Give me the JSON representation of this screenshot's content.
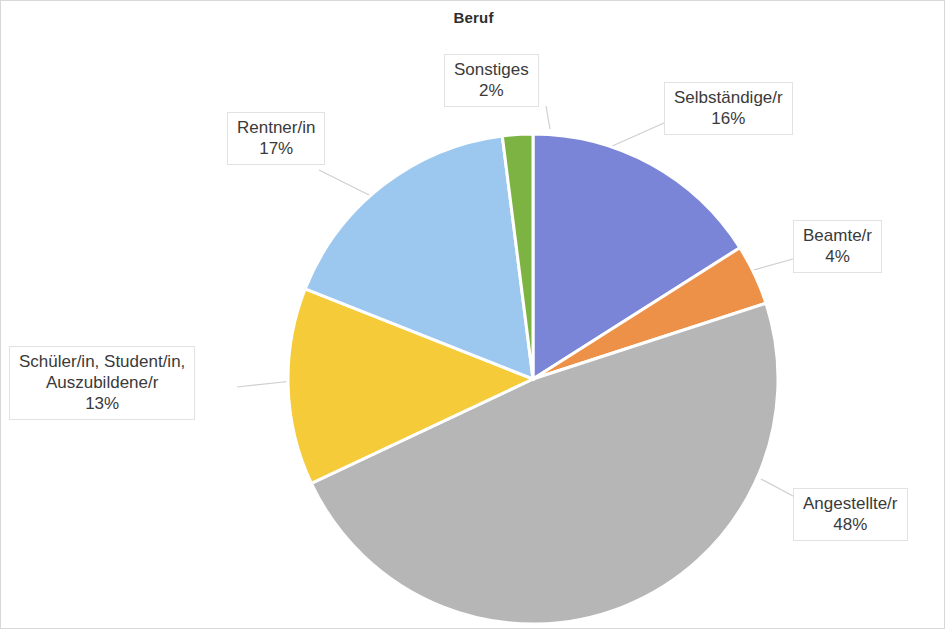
{
  "chart": {
    "title": "Beruf"
  },
  "chart_data": {
    "type": "pie",
    "title": "Beruf",
    "xlabel": "",
    "ylabel": "",
    "unit": "%",
    "start_angle_deg": 0,
    "direction": "clockwise",
    "legend": "none (direct callout labels with leader lines)",
    "grid": false,
    "categories": [
      "Selbständige/r",
      "Beamte/r",
      "Angestellte/r",
      "Schüler/in, Student/in, Auszubildene/r",
      "Rentner/in",
      "Sonstiges"
    ],
    "values": [
      16,
      4,
      48,
      13,
      17,
      2
    ],
    "labels": [
      "16%",
      "4%",
      "48%",
      "13%",
      "17%",
      "2%"
    ],
    "colors": [
      "#7b85d8",
      "#ed9149",
      "#b6b6b6",
      "#f6cb3a",
      "#9cc8f0",
      "#7cb342"
    ],
    "slices": [
      {
        "name": "Selbständige/r",
        "value": 16,
        "label": "16%",
        "color": "#7b85d8"
      },
      {
        "name": "Beamte/r",
        "value": 4,
        "label": "4%",
        "color": "#ed9149"
      },
      {
        "name": "Angestellte/r",
        "value": 48,
        "label": "48%",
        "color": "#b6b6b6"
      },
      {
        "name": "Schüler/in, Student/in, Auszubildene/r",
        "value": 13,
        "label": "13%",
        "color": "#f6cb3a"
      },
      {
        "name": "Rentner/in",
        "value": 17,
        "label": "17%",
        "color": "#9cc8f0"
      },
      {
        "name": "Sonstiges",
        "value": 2,
        "label": "2%",
        "color": "#7cb342"
      }
    ]
  },
  "callouts": {
    "sonstiges": {
      "name": "Sonstiges",
      "pct": "2%"
    },
    "selbstaendige": {
      "name": "Selbständige/r",
      "pct": "16%"
    },
    "beamte": {
      "name": "Beamte/r",
      "pct": "4%"
    },
    "angestellte": {
      "name": "Angestellte/r",
      "pct": "48%"
    },
    "schueler": {
      "line1": "Schüler/in, Student/in,",
      "line2": "Auszubildene/r",
      "pct": "13%"
    },
    "rentner": {
      "name": "Rentner/in",
      "pct": "17%"
    }
  }
}
